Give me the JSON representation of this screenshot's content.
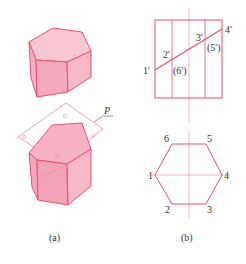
{
  "figure": {
    "panel_a": {
      "caption": "(a)",
      "plane_label": "P",
      "colors": {
        "fill": "#f7b8c8",
        "fill_side": "#f4a6ba",
        "stroke": "#e8506e",
        "plane_stroke": "#e88a9e"
      }
    },
    "panel_b": {
      "caption": "(b)",
      "front_view": {
        "labels": [
          "1'",
          "2'",
          "3'",
          "4'",
          "(5')",
          "(6')"
        ]
      },
      "top_view": {
        "labels": [
          "1",
          "2",
          "3",
          "4",
          "5",
          "6"
        ]
      },
      "colors": {
        "stroke": "#e8506e",
        "center_line": "#e88a9e"
      }
    }
  }
}
